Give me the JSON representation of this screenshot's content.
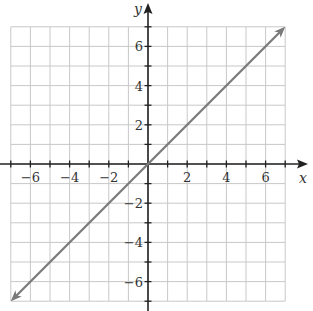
{
  "chart_data": {
    "type": "line",
    "title": "",
    "xlabel": "x",
    "ylabel": "y",
    "xlim": [
      -7,
      7
    ],
    "ylim": [
      -7,
      7
    ],
    "grid": true,
    "x_ticks": [
      -6,
      -4,
      -2,
      2,
      4,
      6
    ],
    "y_ticks": [
      -6,
      -4,
      -2,
      2,
      4,
      6
    ],
    "x_tick_labels": [
      "−6",
      "−4",
      "−2",
      "2",
      "4",
      "6"
    ],
    "y_tick_labels": [
      "−6",
      "−4",
      "−2",
      "2",
      "4",
      "6"
    ],
    "series": [
      {
        "name": "y = x",
        "x": [
          -7,
          7
        ],
        "y": [
          -7,
          7
        ],
        "arrows_both_ends": true,
        "color": "#777777"
      }
    ]
  },
  "colors": {
    "grid": "#c8c8c8",
    "axis": "#222222",
    "line": "#7a7a7a",
    "text": "#333333"
  }
}
